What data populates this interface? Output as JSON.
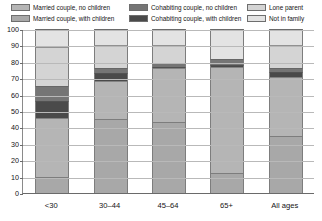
{
  "legend": {
    "items": [
      {
        "label": "Married couple, no children",
        "color": "#b5b5b5",
        "key": "married_no_children"
      },
      {
        "label": "Cohabiting couple, no children",
        "color": "#757575",
        "key": "cohab_no_children"
      },
      {
        "label": "Lone parent",
        "color": "#d4d4d4",
        "key": "lone_parent"
      },
      {
        "label": "Married couple, with children",
        "color": "#a8a8a8",
        "key": "married_with_children"
      },
      {
        "label": "Cohabiting couple, with children",
        "color": "#4a4a4a",
        "key": "cohab_with_children"
      },
      {
        "label": "Not in family",
        "color": "#e3e3e3",
        "key": "not_in_family"
      }
    ]
  },
  "chart_data": {
    "type": "bar",
    "title": "",
    "xlabel": "",
    "ylabel": "",
    "ylim": [
      0,
      100
    ],
    "yticks": [
      0,
      10,
      20,
      30,
      40,
      50,
      60,
      70,
      80,
      90,
      100
    ],
    "grid": true,
    "stacked": true,
    "legend_position": "top",
    "categories": [
      "<30",
      "30–44",
      "45–64",
      "65+",
      "All ages"
    ],
    "series": [
      {
        "name": "Married couple, with children",
        "color": "#a8a8a8",
        "values": [
          10,
          45,
          43,
          12,
          35
        ]
      },
      {
        "name": "Married couple, no children",
        "color": "#b5b5b5",
        "values": [
          36,
          23,
          33,
          65,
          36
        ]
      },
      {
        "name": "Cohabiting couple, with children",
        "color": "#4a4a4a",
        "values": [
          10,
          5,
          1,
          1,
          3
        ]
      },
      {
        "name": "Cohabiting couple, no children",
        "color": "#757575",
        "values": [
          9,
          3,
          2,
          4,
          2
        ]
      },
      {
        "name": "Lone parent",
        "color": "#d4d4d4",
        "values": [
          24,
          14,
          11,
          0,
          14
        ]
      },
      {
        "name": "Not in family",
        "color": "#e3e3e3",
        "values": [
          11,
          10,
          10,
          18,
          10
        ]
      }
    ]
  }
}
